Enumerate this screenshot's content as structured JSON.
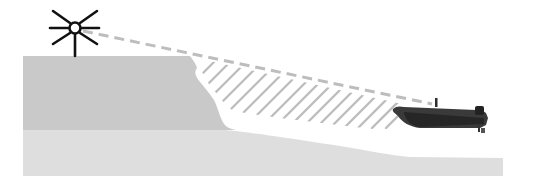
{
  "diagram": {
    "title": "Light source line of sight over cliff to boat, showing shadow zone",
    "elements": {
      "light_source": "light-source-icon",
      "line_of_sight": "dashed-sight-line",
      "land": "cliff-landmass",
      "shadow_zone": "hatched-shadow-area",
      "seabed": "seabed-slope",
      "boat": "boat-with-outboard-motor"
    },
    "colors": {
      "background": "#ffffff",
      "land": "#c9c9c9",
      "seabed": "#dedede",
      "seabed_far": "#d9d9d9",
      "sight_line": "#bdbdbd",
      "hatch": "#bdbdbd",
      "boat": "#3a3a3a",
      "light": "#111111"
    }
  }
}
